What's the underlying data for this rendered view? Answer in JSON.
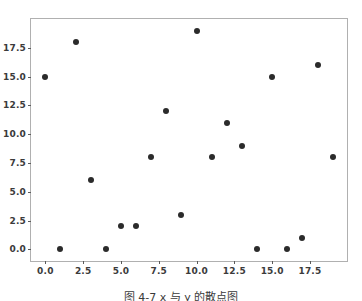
{
  "figure": {
    "background_color": "#ffffff",
    "caption": "图 4-7  x 与 y 的散点图"
  },
  "chart_data": {
    "type": "scatter",
    "title": "",
    "subtitle": "",
    "xlabel": "",
    "ylabel": "",
    "xlim": [
      -0.95,
      19.95
    ],
    "ylim": [
      -1.0,
      20.0
    ],
    "grid": false,
    "legend": null,
    "marker": {
      "shape": "circle",
      "color": "#2b2b2b",
      "size_px": 6
    },
    "frame_color": "#b0b0b0",
    "tick_color": "#5a5a5a",
    "tick_label_color": "#3b3b3b",
    "xticks": [
      0.0,
      2.5,
      5.0,
      7.5,
      10.0,
      12.5,
      15.0,
      17.5
    ],
    "xtick_labels": [
      "0.0",
      "2.5",
      "5.0",
      "7.5",
      "10.0",
      "12.5",
      "15.0",
      "17.5"
    ],
    "yticks": [
      0.0,
      2.5,
      5.0,
      7.5,
      10.0,
      12.5,
      15.0,
      17.5
    ],
    "ytick_labels": [
      "0.0",
      "2.5",
      "5.0",
      "7.5",
      "10.0",
      "12.5",
      "15.0",
      "17.5"
    ],
    "x": [
      0,
      1,
      2,
      3,
      4,
      5,
      6,
      7,
      8,
      9,
      10,
      11,
      12,
      13,
      14,
      15,
      16,
      17,
      18,
      19
    ],
    "y": [
      15,
      0,
      18,
      6,
      0,
      2,
      2,
      8,
      12,
      3,
      19,
      8,
      11,
      9,
      0,
      15,
      0,
      1,
      16,
      8
    ],
    "points": [
      {
        "x": 0,
        "y": 15
      },
      {
        "x": 1,
        "y": 0
      },
      {
        "x": 2,
        "y": 18
      },
      {
        "x": 3,
        "y": 6
      },
      {
        "x": 4,
        "y": 0
      },
      {
        "x": 5,
        "y": 2
      },
      {
        "x": 6,
        "y": 2
      },
      {
        "x": 7,
        "y": 8
      },
      {
        "x": 8,
        "y": 12
      },
      {
        "x": 9,
        "y": 3
      },
      {
        "x": 10,
        "y": 19
      },
      {
        "x": 11,
        "y": 8
      },
      {
        "x": 12,
        "y": 11
      },
      {
        "x": 13,
        "y": 9
      },
      {
        "x": 14,
        "y": 0
      },
      {
        "x": 15,
        "y": 15
      },
      {
        "x": 16,
        "y": 0
      },
      {
        "x": 17,
        "y": 1
      },
      {
        "x": 18,
        "y": 16
      },
      {
        "x": 19,
        "y": 8
      }
    ]
  }
}
